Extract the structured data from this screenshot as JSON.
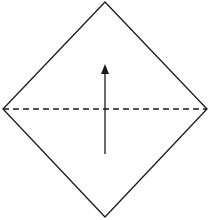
{
  "diagram": {
    "type": "origami-fold-step",
    "colors": {
      "background": "#ffffff",
      "stroke": "#1a1a1a"
    },
    "diamond": {
      "top": [
        105,
        2
      ],
      "right": [
        207,
        109
      ],
      "bottom": [
        105,
        217
      ],
      "left": [
        3,
        109
      ]
    },
    "fold_line": {
      "style": "dashed",
      "from": [
        3,
        109
      ],
      "to": [
        207,
        109
      ]
    },
    "arrow": {
      "direction": "up",
      "from": [
        105,
        154
      ],
      "to": [
        105,
        66
      ]
    }
  }
}
